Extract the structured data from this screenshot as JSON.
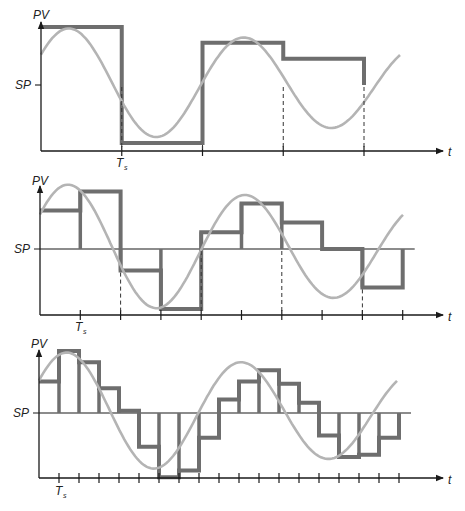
{
  "figure": {
    "colors": {
      "axis": "#1a1a1a",
      "sampled": "#6e6e6e",
      "continuous": "#b4b4b4"
    }
  },
  "panels": [
    {
      "y_label": "PV",
      "sp_label": "SP",
      "x_label": "t",
      "ts_label": "T",
      "ts_sub": "s",
      "samples": 4,
      "sp_style": "tick",
      "sampled_values": [
        0.55,
        -0.55,
        0.4,
        0.25
      ],
      "description": "Coarse sampling: 4 samples per shown interval"
    },
    {
      "y_label": "PV",
      "sp_label": "SP",
      "x_label": "t",
      "ts_label": "T",
      "ts_sub": "s",
      "samples": 9,
      "sp_style": "line",
      "sampled_values": [
        0.32,
        0.48,
        -0.18,
        -0.5,
        0.14,
        0.38,
        0.22,
        0.0,
        -0.32
      ],
      "description": "Medium sampling: 9 samples"
    },
    {
      "y_label": "PV",
      "sp_label": "SP",
      "x_label": "t",
      "ts_label": "T",
      "ts_sub": "s",
      "samples": 18,
      "sp_style": "line",
      "sampled_values": [
        0.28,
        0.55,
        0.45,
        0.22,
        0.02,
        -0.3,
        -0.57,
        -0.51,
        -0.22,
        0.12,
        0.28,
        0.38,
        0.26,
        0.09,
        -0.2,
        -0.39,
        -0.37,
        -0.22
      ],
      "description": "Fine sampling: 18 samples"
    }
  ]
}
